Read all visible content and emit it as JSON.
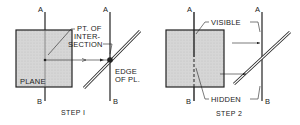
{
  "step1": {
    "caption": "STEP I",
    "line_top_label": "A",
    "line_bottom_label": "B",
    "proj_top_label": "A",
    "proj_bottom_label": "B",
    "plane_label": "PLANE",
    "point_label_1": "PT. OF",
    "point_label_2": "INTER-",
    "point_label_3": "SECTION",
    "edge_label_1": "EDGE",
    "edge_label_2": "OF PL."
  },
  "step2": {
    "caption": "STEP 2",
    "line_top_label": "A",
    "line_bottom_label": "B",
    "proj_top_label": "A",
    "proj_bottom_label": "B",
    "visible_label": "VISIBLE",
    "hidden_label": "HIDDEN"
  },
  "colors": {
    "plane_fill": "#d4d4d4",
    "line": "#222222"
  }
}
